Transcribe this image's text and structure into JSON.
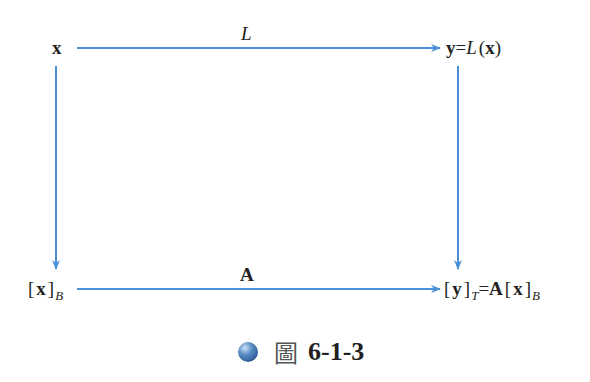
{
  "diagram": {
    "nodes": {
      "top_left": {
        "text": "x"
      },
      "top_right": {
        "y": "y",
        "eq": "=",
        "L": "L",
        "open": "(",
        "x": "x",
        "close": ")"
      },
      "bottom_left": {
        "lb": "[",
        "x": "x",
        "rb": "]",
        "sub": "B"
      },
      "bottom_right": {
        "lb1": "[",
        "y": "y",
        "rb1": "]",
        "sub1": "T",
        "eq": "=",
        "A": "A",
        "lb2": "[",
        "x": "x",
        "rb2": "]",
        "sub2": "B"
      }
    },
    "edges": {
      "top": {
        "label": "L"
      },
      "bottom": {
        "label": "A"
      }
    },
    "arrow_color": "#4a90d9"
  },
  "caption": {
    "prefix": "圖",
    "number": "6-1-3"
  }
}
